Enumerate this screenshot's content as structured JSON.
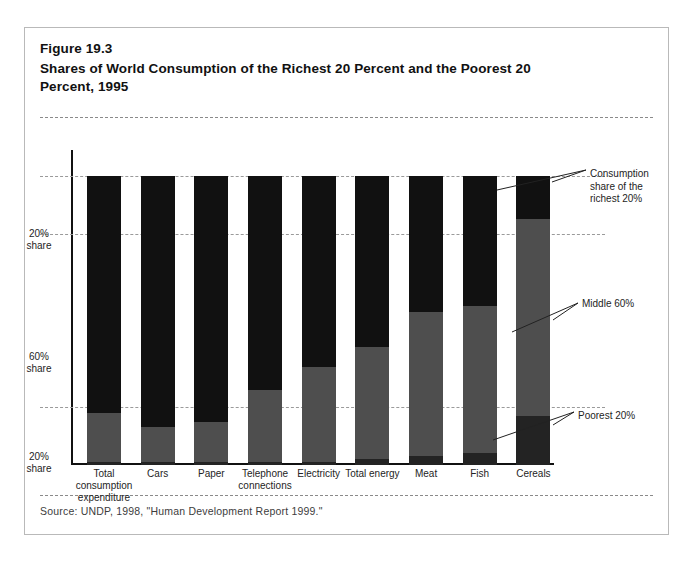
{
  "figure": {
    "number": "Figure 19.3",
    "title": "Shares of World Consumption of the Richest 20 Percent and the Poorest 20 Percent, 1995",
    "source": "Source:  UNDP, 1998, \"Human Development Report 1999.\""
  },
  "annotations": {
    "richest": "Consumption share of the richest 20%",
    "middle": "Middle 60%",
    "poorest": "Poorest 20%"
  },
  "y_ticks": [
    {
      "line1": "20%",
      "line2": "share"
    },
    {
      "line1": "60%",
      "line2": "share"
    },
    {
      "line1": "20%",
      "line2": "share"
    }
  ],
  "x_labels": [
    {
      "line1": "Total",
      "line2": "consumption",
      "line3": "expenditure"
    },
    {
      "line1": "Cars",
      "line2": "",
      "line3": ""
    },
    {
      "line1": "Paper",
      "line2": "",
      "line3": ""
    },
    {
      "line1": "Telephone",
      "line2": "connections",
      "line3": ""
    },
    {
      "line1": "Electricity",
      "line2": "",
      "line3": ""
    },
    {
      "line1": "Total energy",
      "line2": "",
      "line3": ""
    },
    {
      "line1": "Meat",
      "line2": "",
      "line3": ""
    },
    {
      "line1": "Fish",
      "line2": "",
      "line3": ""
    },
    {
      "line1": "Cereals",
      "line2": "",
      "line3": ""
    }
  ],
  "colors": {
    "richest": "#111111",
    "middle": "#4e4e4e",
    "poorest": "#232323",
    "frame": "#b9b9b9",
    "gridline": "#9a9a9a",
    "axis": "#111111",
    "background": "#ffffff"
  },
  "chart_data": {
    "type": "bar",
    "stacked": true,
    "title": "Shares of World Consumption of the Richest 20 Percent and the Poorest 20 Percent, 1995",
    "xlabel": "",
    "ylabel": "Share of world consumption (%)",
    "ylim": [
      0,
      100
    ],
    "grid": true,
    "gridlines_at": [
      20,
      80,
      100
    ],
    "legend_position": "right-annotations",
    "y_tick_labels": [
      "20% share",
      "60% share",
      "20% share"
    ],
    "y_tick_values": [
      90,
      50,
      10
    ],
    "categories": [
      "Total consumption expenditure",
      "Cars",
      "Paper",
      "Telephone connections",
      "Electricity",
      "Total energy",
      "Meat",
      "Fish",
      "Cereals"
    ],
    "series": [
      {
        "name": "Consumption share of the richest 20%",
        "color": "#111111",
        "values": [
          82,
          87,
          85,
          74,
          66,
          59,
          47,
          45,
          15
        ]
      },
      {
        "name": "Middle 60%",
        "color": "#4e4e4e",
        "values": [
          17,
          12,
          14,
          25,
          33,
          39,
          50,
          51,
          68
        ]
      },
      {
        "name": "Poorest 20%",
        "color": "#232323",
        "values": [
          1,
          1,
          1,
          1,
          1,
          2,
          3,
          4,
          17
        ]
      }
    ]
  }
}
